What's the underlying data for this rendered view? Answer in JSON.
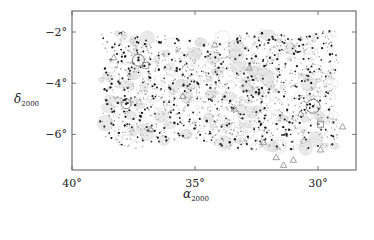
{
  "chart_data": {
    "type": "scatter",
    "title": "",
    "xlabel": "α2000",
    "xlabel_main": "α",
    "xlabel_sub": "2000",
    "ylabel": "δ2000",
    "ylabel_main": "δ",
    "ylabel_sub": "2000",
    "xlim": [
      40.0,
      28.6
    ],
    "ylim": [
      -1.2,
      -7.4
    ],
    "x_inverted": true,
    "xticks": [
      40,
      35,
      30
    ],
    "xtick_labels": [
      "40°",
      "35°",
      "30°"
    ],
    "yticks": [
      -2,
      -4,
      -6
    ],
    "ytick_labels": [
      "−2°",
      "−4°",
      "−6°"
    ],
    "grid": false,
    "legend": null,
    "survey_region": {
      "ra_range": [
        38.9,
        29.0
      ],
      "dec_range": [
        -1.9,
        -6.6
      ],
      "description": "Irregular rectangular survey footprint with grey density contours; notch in upper edge near RA 35°"
    },
    "series": [
      {
        "name": "sources (black dots)",
        "marker": "dot",
        "color": "#1a1a1a",
        "approx_count": 420
      },
      {
        "name": "faint sources (grey dots)",
        "marker": "dot",
        "color": "#9a9a9a",
        "approx_count": 1200
      },
      {
        "name": "triangles",
        "marker": "triangle-open",
        "color": "#777777",
        "points": [
          {
            "ra": 31.0,
            "dec": -7.0
          },
          {
            "ra": 31.7,
            "dec": -6.9
          },
          {
            "ra": 31.4,
            "dec": -7.2
          },
          {
            "ra": 29.9,
            "dec": -6.6
          },
          {
            "ra": 32.2,
            "dec": -6.3
          },
          {
            "ra": 29.0,
            "dec": -5.7
          },
          {
            "ra": 30.7,
            "dec": -5.2
          },
          {
            "ra": 35.5,
            "dec": -4.5
          },
          {
            "ra": 34.2,
            "dec": -2.5
          },
          {
            "ra": 36.8,
            "dec": -5.8
          },
          {
            "ra": 33.4,
            "dec": -5.0
          },
          {
            "ra": 38.3,
            "dec": -3.0
          },
          {
            "ra": 32.8,
            "dec": -3.4
          }
        ]
      },
      {
        "name": "circled sources",
        "marker": "circle-open",
        "color": "#666666",
        "points": [
          {
            "ra": 30.2,
            "dec": -4.9,
            "r": 7
          },
          {
            "ra": 37.3,
            "dec": -3.1,
            "r": 6
          },
          {
            "ra": 37.8,
            "dec": -4.8,
            "r": 5
          }
        ]
      },
      {
        "name": "boxed sources",
        "marker": "square-open",
        "color": "#777777",
        "points": [
          {
            "ra": 29.9,
            "dec": -5.6
          },
          {
            "ra": 37.0,
            "dec": -3.3
          }
        ]
      }
    ]
  },
  "layout": {
    "frame": {
      "left": 72,
      "top": 11,
      "right": 356,
      "bottom": 170
    },
    "px_per_deg_x": 24.6,
    "px_per_deg_y": 25.6,
    "x0_deg": 40.0,
    "y0_deg": -2.0,
    "y0_px": 32,
    "colors": {
      "frame": "#555555",
      "contour": "#bdbdbd",
      "contour_fill": "#e6e6e6",
      "dot_dark": "#1a1a1a",
      "dot_light": "#9e9e9e",
      "marker": "#777777"
    },
    "seed": 20001
  }
}
